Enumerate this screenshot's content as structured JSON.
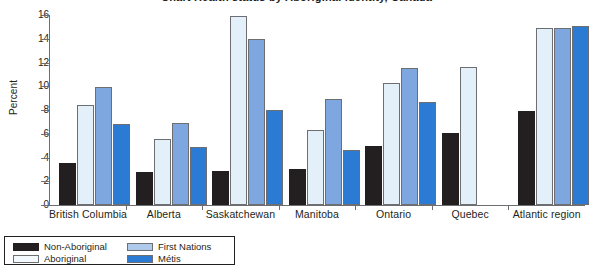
{
  "chart_data": {
    "type": "bar",
    "title": "Chart  Health status by Aboriginal identity, Canada",
    "xlabel": "",
    "ylabel": "Percent",
    "ylim": [
      0,
      16
    ],
    "yticks": [
      0,
      2,
      4,
      6,
      8,
      10,
      12,
      14,
      16
    ],
    "grid": false,
    "legend_position": "bottom-left",
    "categories": [
      "British Columbia",
      "Alberta",
      "Saskatchewan",
      "Manitoba",
      "Ontario",
      "Quebec",
      "Atlantic region"
    ],
    "series": [
      {
        "name": "Non-Aboriginal",
        "color": "#231f20",
        "values": [
          3.5,
          2.8,
          2.9,
          3.0,
          5.0,
          6.1,
          7.9
        ]
      },
      {
        "name": "Aboriginal",
        "color": "#e4f0f9",
        "values": [
          8.4,
          5.6,
          15.9,
          6.3,
          10.3,
          11.6,
          14.9
        ]
      },
      {
        "name": "First Nations",
        "color": "#7da7de",
        "values": [
          9.9,
          6.9,
          14.0,
          8.9,
          11.5,
          null,
          14.9
        ]
      },
      {
        "name": "Métis",
        "color": "#2b7bd4",
        "values": [
          6.8,
          4.9,
          8.0,
          4.6,
          8.7,
          null,
          15.1
        ]
      }
    ]
  },
  "legend": {
    "entries": [
      {
        "label": "Non-Aboriginal",
        "swatch": "black-swatch"
      },
      {
        "label": "Aboriginal",
        "swatch": "pale-blue-swatch"
      },
      {
        "label": "First Nations",
        "swatch": "light-blue-swatch"
      },
      {
        "label": "Métis",
        "swatch": "blue-swatch"
      }
    ]
  }
}
